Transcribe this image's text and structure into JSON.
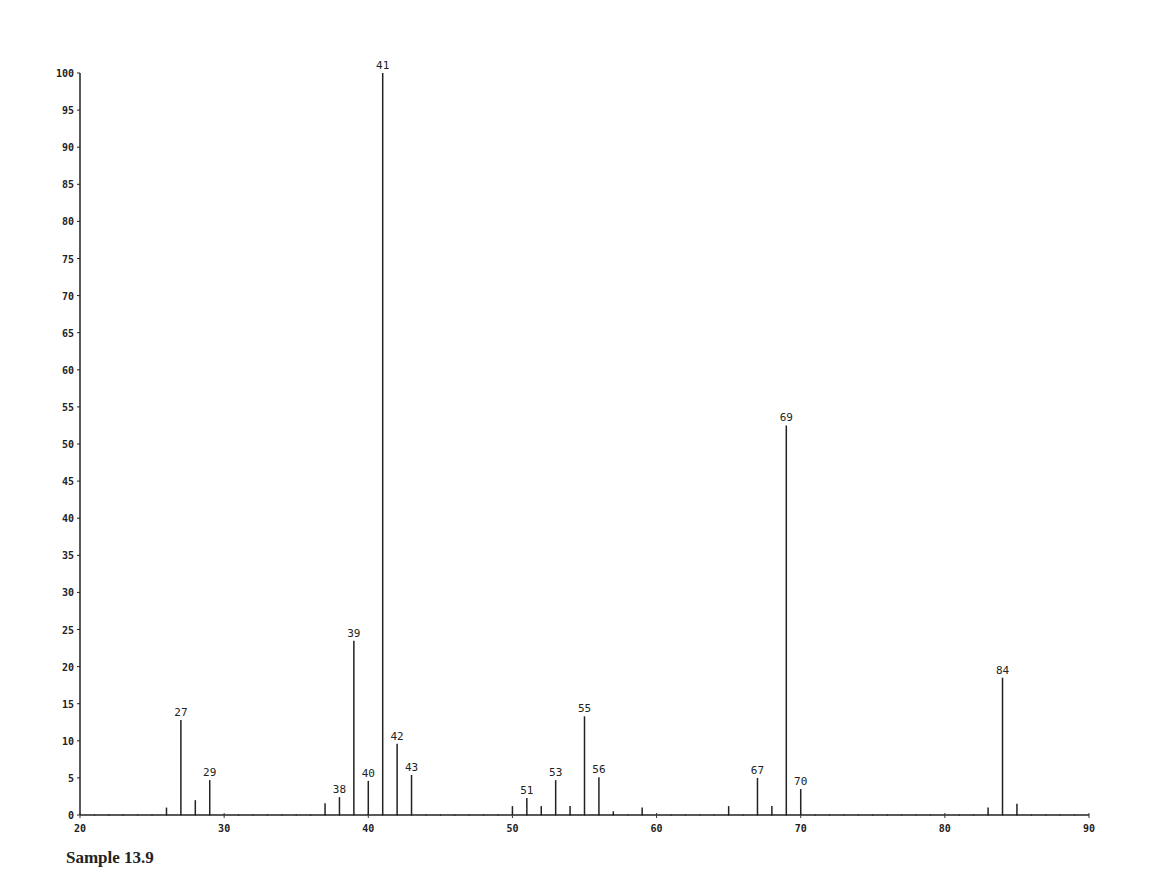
{
  "chart_data": {
    "type": "bar",
    "title": "",
    "caption": "Sample 13.9",
    "xlabel": "",
    "ylabel": "",
    "xlim": [
      20,
      90
    ],
    "ylim": [
      0,
      100
    ],
    "grid": false,
    "legend": null,
    "x_ticks": [
      20,
      30,
      40,
      50,
      60,
      70,
      80,
      90
    ],
    "x_tick_labels": [
      "20",
      "30",
      "40",
      "50",
      "60",
      "70",
      "80",
      "90"
    ],
    "y_ticks": [
      0,
      5,
      10,
      15,
      20,
      25,
      30,
      35,
      40,
      45,
      50,
      55,
      60,
      65,
      70,
      75,
      80,
      85,
      90,
      95,
      100
    ],
    "y_tick_labels": [
      "0",
      "5",
      "10",
      "15",
      "20",
      "25",
      "30",
      "35",
      "40",
      "45",
      "50",
      "55",
      "60",
      "65",
      "70",
      "75",
      "80",
      "85",
      "90",
      "95",
      "100"
    ],
    "peaks": [
      {
        "mz": 26,
        "intensity": 1.0,
        "labeled": false
      },
      {
        "mz": 27,
        "intensity": 12.8,
        "labeled": true
      },
      {
        "mz": 28,
        "intensity": 2.0,
        "labeled": false
      },
      {
        "mz": 29,
        "intensity": 4.7,
        "labeled": true
      },
      {
        "mz": 37,
        "intensity": 1.6,
        "labeled": false
      },
      {
        "mz": 38,
        "intensity": 2.4,
        "labeled": true
      },
      {
        "mz": 39,
        "intensity": 23.5,
        "labeled": true
      },
      {
        "mz": 40,
        "intensity": 4.6,
        "labeled": true
      },
      {
        "mz": 41,
        "intensity": 100,
        "labeled": true
      },
      {
        "mz": 42,
        "intensity": 9.6,
        "labeled": true
      },
      {
        "mz": 43,
        "intensity": 5.4,
        "labeled": true
      },
      {
        "mz": 50,
        "intensity": 1.2,
        "labeled": false
      },
      {
        "mz": 51,
        "intensity": 2.3,
        "labeled": true
      },
      {
        "mz": 52,
        "intensity": 1.2,
        "labeled": false
      },
      {
        "mz": 53,
        "intensity": 4.7,
        "labeled": true
      },
      {
        "mz": 54,
        "intensity": 1.2,
        "labeled": false
      },
      {
        "mz": 55,
        "intensity": 13.3,
        "labeled": true
      },
      {
        "mz": 56,
        "intensity": 5.1,
        "labeled": true
      },
      {
        "mz": 57,
        "intensity": 0.5,
        "labeled": false
      },
      {
        "mz": 59,
        "intensity": 1.0,
        "labeled": false
      },
      {
        "mz": 65,
        "intensity": 1.2,
        "labeled": false
      },
      {
        "mz": 67,
        "intensity": 5.0,
        "labeled": true
      },
      {
        "mz": 68,
        "intensity": 1.2,
        "labeled": false
      },
      {
        "mz": 69,
        "intensity": 52.5,
        "labeled": true
      },
      {
        "mz": 70,
        "intensity": 3.5,
        "labeled": true
      },
      {
        "mz": 83,
        "intensity": 1.0,
        "labeled": false
      },
      {
        "mz": 84,
        "intensity": 18.5,
        "labeled": true
      },
      {
        "mz": 85,
        "intensity": 1.5,
        "labeled": false
      }
    ]
  },
  "caption": "Sample 13.9"
}
